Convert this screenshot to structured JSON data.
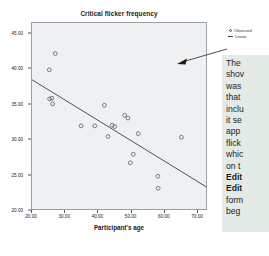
{
  "chart_data": {
    "type": "scatter",
    "title": "Critical flicker frequency",
    "xlabel": "Participant's age",
    "ylabel": "",
    "xlim": [
      20,
      73
    ],
    "ylim": [
      20,
      46.5
    ],
    "xticks": [
      "20.00",
      "30.00",
      "40.00",
      "50.00",
      "60.00",
      "70.00"
    ],
    "xtick_values": [
      20,
      30,
      40,
      50,
      60,
      70
    ],
    "yticks": [
      "45.00",
      "40.00",
      "35.00",
      "30.00",
      "25.00",
      "20.00"
    ],
    "ytick_values": [
      45,
      40,
      35,
      30,
      25,
      20
    ],
    "grid": false,
    "legend_position": "top-right",
    "series": [
      {
        "name": "Observed",
        "marker": "open-circle",
        "points": [
          {
            "x": 27.0,
            "y": 42.2
          },
          {
            "x": 25.2,
            "y": 39.9
          },
          {
            "x": 25.3,
            "y": 35.8
          },
          {
            "x": 26.0,
            "y": 35.9
          },
          {
            "x": 26.2,
            "y": 35.1
          },
          {
            "x": 41.8,
            "y": 34.9
          },
          {
            "x": 47.9,
            "y": 33.5
          },
          {
            "x": 48.9,
            "y": 33.1
          },
          {
            "x": 44.1,
            "y": 32.1
          },
          {
            "x": 44.9,
            "y": 31.9
          },
          {
            "x": 34.8,
            "y": 32.0
          },
          {
            "x": 38.9,
            "y": 32.0
          },
          {
            "x": 52.0,
            "y": 30.9
          },
          {
            "x": 65.0,
            "y": 30.4
          },
          {
            "x": 42.9,
            "y": 30.5
          },
          {
            "x": 50.5,
            "y": 28.0
          },
          {
            "x": 49.6,
            "y": 26.8
          },
          {
            "x": 57.9,
            "y": 24.9
          },
          {
            "x": 58.0,
            "y": 23.2
          }
        ]
      },
      {
        "name": "Linear",
        "type": "fit-line",
        "endpoints": [
          {
            "x": 20.0,
            "y": 38.5
          },
          {
            "x": 72.5,
            "y": 23.4
          }
        ]
      }
    ],
    "legend": [
      {
        "label": "Observed",
        "marker": "open-circle"
      },
      {
        "label": "Linear",
        "marker": "line"
      }
    ]
  },
  "annotation": {
    "arrow": "arrow-pointing-left-into-plot",
    "lines": [
      {
        "text": "The",
        "bold": false
      },
      {
        "text": "shov",
        "bold": false
      },
      {
        "text": "was",
        "bold": false
      },
      {
        "text": "that",
        "bold": false
      },
      {
        "text": "inclu",
        "bold": false
      },
      {
        "text": "it se",
        "bold": false
      },
      {
        "text": "app",
        "bold": false
      },
      {
        "text": "flick",
        "bold": false
      },
      {
        "text": "whic",
        "bold": false
      },
      {
        "text": "on t",
        "bold": false
      },
      {
        "text": "Edit",
        "bold": true
      },
      {
        "text": "Edit",
        "bold": true
      },
      {
        "text": "form",
        "bold": false
      },
      {
        "text": "beg",
        "bold": false
      }
    ]
  },
  "colors": {
    "plot_background": "#eef0f2",
    "plot_border": "#9aa0a6",
    "marker_stroke": "#5b6064",
    "fit_line": "#3c4043",
    "callout_background": "#e4ebe6",
    "page_background": "#ffffff",
    "text": "#1d1d1d"
  }
}
